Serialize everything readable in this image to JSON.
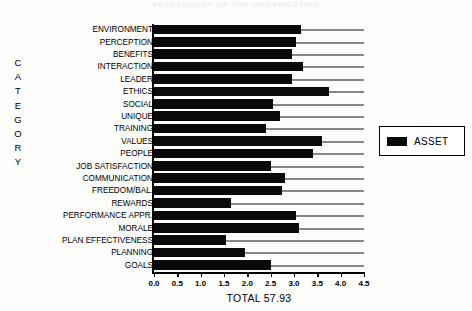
{
  "title": "ASSESSMENT  OF  THE  ORGANIZATION",
  "category_axis_title": "CATEGORY",
  "category_axis_letters": [
    "C",
    "A",
    "T",
    "E",
    "G",
    "O",
    "R",
    "Y"
  ],
  "legend": {
    "position": "right",
    "entries": [
      {
        "label": "ASSET",
        "color": "#0a0a0a",
        "swatch": "black-filled-rect"
      }
    ]
  },
  "total_caption": "TOTAL 57.93",
  "chart_data": {
    "type": "bar",
    "orientation": "horizontal",
    "title": "ASSESSMENT  OF  THE  ORGANIZATION",
    "xlabel": "",
    "ylabel": "CATEGORY",
    "xlim": [
      0.0,
      4.5
    ],
    "ylim": null,
    "grid": true,
    "legend_position": "right",
    "xticks": [
      "0.0",
      "0.5",
      "1.0",
      "1.5",
      "2.0",
      "2.5",
      "3.0",
      "3.5",
      "4.0",
      "4.5"
    ],
    "xtick_values": [
      0.0,
      0.5,
      1.0,
      1.5,
      2.0,
      2.5,
      3.0,
      3.5,
      4.0,
      4.5
    ],
    "categories": [
      "ENVIRONMENT",
      "PERCEPTION",
      "BENEFITS",
      "INTERACTION",
      "LEADER",
      "ETHICS",
      "SOCIAL",
      "UNIQUE",
      "TRAINING",
      "VALUES",
      "PEOPLE",
      "JOB SATISFACTION",
      "COMMUNICATION",
      "FREEDOM/BAL.",
      "REWARDS",
      "PERFORMANCE APPR.",
      "MORALE",
      "PLAN EFFECTIVENESS",
      "PLANNING",
      "GOALS"
    ],
    "series": [
      {
        "name": "ASSET",
        "color": "#0a0a0a",
        "values": [
          3.15,
          3.05,
          2.95,
          3.2,
          2.95,
          3.75,
          2.55,
          2.7,
          2.4,
          3.6,
          3.4,
          2.5,
          2.8,
          2.75,
          1.65,
          3.05,
          3.1,
          1.55,
          1.95,
          2.5
        ]
      }
    ],
    "annotations": [
      "TOTAL 57.93"
    ]
  }
}
